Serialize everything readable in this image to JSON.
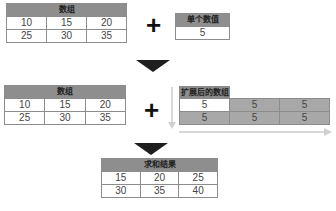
{
  "step1": {
    "array_table": {
      "header": "数组",
      "rows": [
        [
          "10",
          "15",
          "20"
        ],
        [
          "25",
          "30",
          "35"
        ]
      ]
    },
    "operator": "+",
    "scalar_table": {
      "header": "单个数值",
      "value": "5"
    }
  },
  "step2": {
    "array_table": {
      "header": "数组",
      "rows": [
        [
          "10",
          "15",
          "20"
        ],
        [
          "25",
          "30",
          "35"
        ]
      ]
    },
    "operator": "+",
    "expanded_table": {
      "header": "扩展后的数组",
      "rows": [
        [
          "5",
          "5",
          "5"
        ],
        [
          "5",
          "5",
          "5"
        ]
      ]
    }
  },
  "step3": {
    "result_table": {
      "header": "求和结果",
      "rows": [
        [
          "15",
          "20",
          "25"
        ],
        [
          "30",
          "35",
          "40"
        ]
      ]
    }
  },
  "colors": {
    "header_bg": "#8e8e8e",
    "broadcast_cell_bg": "#a8a8a8",
    "arrow": "#1e1e1e",
    "broadcast_arrow": "#d9d9d9"
  }
}
